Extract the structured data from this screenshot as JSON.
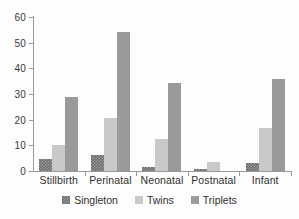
{
  "chart_data": {
    "type": "bar",
    "title": "",
    "subtitle": "",
    "xlabel": "",
    "ylabel": "",
    "categories": [
      "Stillbirth",
      "Perinatal",
      "Neonatal",
      "Postnatal",
      "Infant"
    ],
    "series": [
      {
        "name": "Singleton",
        "color": "#6e6e6e",
        "values": [
          4.5,
          6.2,
          1.7,
          0.7,
          3.0
        ]
      },
      {
        "name": "Twins",
        "color": "#c9c9c9",
        "values": [
          10.3,
          20.5,
          12.5,
          3.7,
          16.6
        ]
      },
      {
        "name": "Triplets",
        "color": "#9a9a9a",
        "values": [
          28.7,
          54.0,
          34.3,
          0.2,
          36.0
        ]
      }
    ],
    "ylim": [
      0,
      60
    ],
    "yticks": [
      0,
      10,
      20,
      30,
      40,
      50,
      60
    ],
    "ytick_labels": [
      "0",
      "10",
      "20",
      "30",
      "40",
      "50",
      "60"
    ],
    "grid": false,
    "legend_position": "bottom",
    "annotations": []
  },
  "axes": {
    "y_axis_color": "#9a9a9a",
    "x_axis_color": "#9a9a9a",
    "background": "#fdfdfd"
  },
  "legend": {
    "items": [
      {
        "label": "Singleton"
      },
      {
        "label": "Twins"
      },
      {
        "label": "Triplets"
      }
    ]
  }
}
